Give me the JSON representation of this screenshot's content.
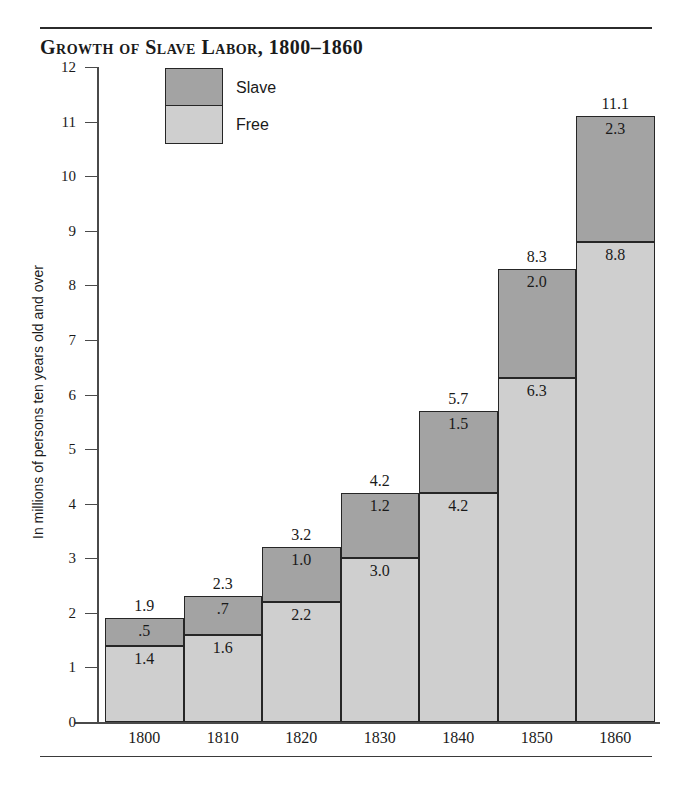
{
  "figure": {
    "title": "Growth of Slave Labor, 1800–1860"
  },
  "legend": {
    "items": [
      {
        "key": "slave",
        "label": "Slave",
        "color": "#a3a3a3"
      },
      {
        "key": "free",
        "label": "Free",
        "color": "#cfcfcf"
      }
    ]
  },
  "axes": {
    "y_title": "In millions of persons ten years old and over",
    "y_ticks": [
      "0",
      "1",
      "2",
      "3",
      "4",
      "5",
      "6",
      "7",
      "8",
      "9",
      "10",
      "11",
      "12"
    ],
    "x_ticks": [
      "1800",
      "1810",
      "1820",
      "1830",
      "1840",
      "1850",
      "1860"
    ]
  },
  "chart_data": {
    "type": "bar",
    "stacked": true,
    "title": "Growth of Slave Labor, 1800–1860",
    "xlabel": "",
    "ylabel": "In millions of persons ten years old and over",
    "ylim": [
      0,
      12
    ],
    "ytick_step": 1,
    "grid": false,
    "legend_position": "top-left-inside",
    "categories": [
      "1800",
      "1810",
      "1820",
      "1830",
      "1840",
      "1850",
      "1860"
    ],
    "series": [
      {
        "name": "Free",
        "color": "#cfcfcf",
        "values": [
          1.4,
          1.6,
          2.2,
          3.0,
          4.2,
          6.3,
          8.8
        ],
        "labels": [
          "1.4",
          "1.6",
          "2.2",
          "3.0",
          "4.2",
          "6.3",
          "8.8"
        ]
      },
      {
        "name": "Slave",
        "color": "#a3a3a3",
        "values": [
          0.5,
          0.7,
          1.0,
          1.2,
          1.5,
          2.0,
          2.3
        ],
        "labels": [
          ".5",
          ".7",
          "1.0",
          "1.2",
          "1.5",
          "2.0",
          "2.3"
        ]
      }
    ],
    "totals": [
      1.9,
      2.3,
      3.2,
      4.2,
      5.7,
      8.3,
      11.1
    ],
    "total_labels": [
      "1.9",
      "2.3",
      "3.2",
      "4.2",
      "5.7",
      "8.3",
      "11.1"
    ]
  }
}
